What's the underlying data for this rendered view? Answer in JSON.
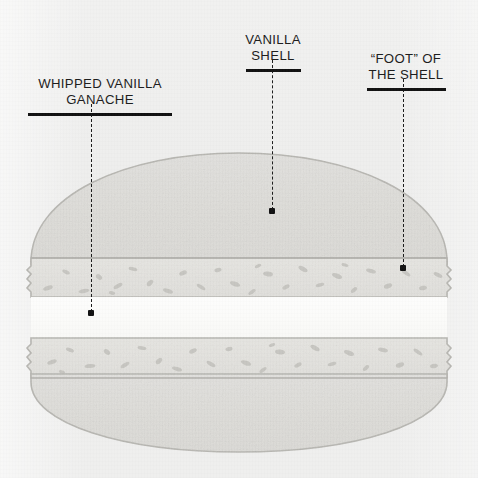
{
  "diagram": {
    "background_color": "#efefee"
  },
  "labels": [
    {
      "id": "whipped-vanilla-ganache",
      "text": "WHIPPED VANILLA\nGANACHE",
      "rule_width": 144,
      "box": {
        "left": 18,
        "top": 59,
        "width": 164
      },
      "leader": {
        "x": 91,
        "y_start": 104,
        "y_end": 312
      },
      "dot": {
        "x": 91,
        "y": 313
      }
    },
    {
      "id": "vanilla-shell",
      "text": "VANILLA\nSHELL",
      "rule_width": 55,
      "box": {
        "left": 218,
        "top": 15,
        "width": 110
      },
      "leader": {
        "x": 272,
        "y_start": 60,
        "y_end": 210
      },
      "dot": {
        "x": 272,
        "y": 211
      }
    },
    {
      "id": "foot-of-the-shell",
      "text": "“FOOT” OF\nTHE SHELL",
      "rule_width": 79,
      "box": {
        "left": 348,
        "top": 34,
        "width": 116
      },
      "leader": {
        "x": 403,
        "y_start": 79,
        "y_end": 267
      },
      "dot": {
        "x": 403,
        "y": 268
      }
    }
  ],
  "colors": {
    "label_text": "#1b1b1b",
    "rule": "#111111",
    "leader_line": "#1a1a1a",
    "shell_fill": "#dfdedb",
    "shell_stroke": "#b9b8b4",
    "foot_fill": "#e2e1dd",
    "foot_speckle": "#c5c4bf",
    "ganache_fill": "#fbfbfa",
    "background": "#efefee"
  },
  "geometry": {
    "canvas": {
      "width": 478,
      "height": 478
    },
    "top_shell": {
      "dome_top_y": 153,
      "foot_top_y": 258,
      "foot_bottom_y": 297,
      "left_x": 31,
      "right_x": 447
    },
    "ganache": {
      "top_y": 297,
      "bottom_y": 338
    },
    "bottom_shell": {
      "foot_top_y": 338,
      "foot_bottom_y": 378,
      "dome_bottom_y": 452,
      "left_x": 31,
      "right_x": 447
    }
  }
}
